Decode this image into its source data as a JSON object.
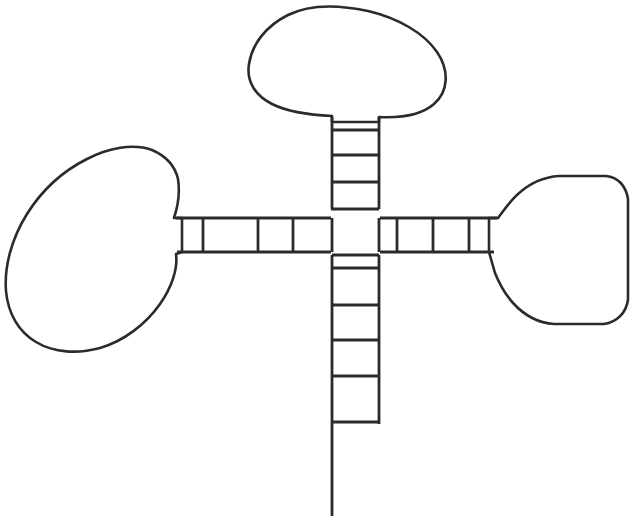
{
  "figure": {
    "title": "Cross-shaped ladder diagram with three rounded lobes",
    "background_color": "#ffffff",
    "stroke_color": "#2b2b2b",
    "stroke_width": 2.6,
    "canvas": {
      "width": 638,
      "height": 528
    },
    "hub": {
      "name": "central-square",
      "x": 331,
      "y": 209,
      "width": 49,
      "height": 46
    },
    "arms": [
      {
        "id": "top-arm",
        "label": "Top ladder arm",
        "orientation": "vertical-up",
        "rail_left_x": 332,
        "rail_right_x": 379,
        "start_y": 209,
        "end_y": 122,
        "rung_count": 3,
        "rung_positions": [
          130,
          155,
          182
        ]
      },
      {
        "id": "left-arm",
        "label": "Left ladder arm",
        "orientation": "horizontal-left",
        "rail_top_y": 218,
        "rail_bottom_y": 252,
        "start_x": 331,
        "end_x": 182,
        "rung_count": 3,
        "rung_positions": [
          203,
          258,
          293
        ]
      },
      {
        "id": "right-arm",
        "label": "Right ladder arm",
        "orientation": "horizontal-right",
        "rail_top_y": 218,
        "rail_bottom_y": 252,
        "start_x": 380,
        "end_x": 489,
        "rung_count": 3,
        "rung_positions": [
          397,
          433,
          469
        ]
      },
      {
        "id": "bottom-arm",
        "label": "Bottom ladder arm with extended left rail",
        "orientation": "vertical-down",
        "rail_left_x": 332,
        "rail_right_x": 379,
        "start_y": 255,
        "end_y": 424,
        "rung_count": 5,
        "rung_positions": [
          268,
          305,
          340,
          376,
          422
        ],
        "left_rail_extends_to_y": 516,
        "right_rail_ends_at_y": 424
      }
    ],
    "lobes": [
      {
        "id": "top-lobe",
        "label": "Top rounded lobe",
        "attached_arm": "top-arm",
        "bbox": {
          "x": 249,
          "y": 8,
          "width": 198,
          "height": 116
        }
      },
      {
        "id": "left-lobe",
        "label": "Left rounded lobe",
        "attached_arm": "left-arm",
        "bbox": {
          "x": 5,
          "y": 147,
          "width": 178,
          "height": 205
        }
      },
      {
        "id": "right-lobe",
        "label": "Right rounded lobe",
        "attached_arm": "right-arm",
        "bbox": {
          "x": 488,
          "y": 176,
          "width": 141,
          "height": 148
        }
      }
    ]
  }
}
